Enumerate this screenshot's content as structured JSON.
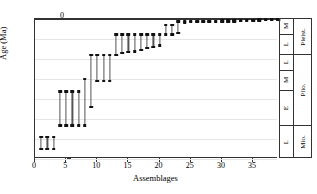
{
  "chart_data": {
    "type": "bar",
    "subtype": "range-bar-with-endpoint-markers",
    "title": "",
    "xlabel": "Assemblages",
    "ylabel": "Age (Ma)",
    "xlim": [
      0,
      39
    ],
    "ylim": [
      7,
      0
    ],
    "y_inverted": true,
    "xticks": [
      0,
      5,
      10,
      15,
      20,
      25,
      30,
      35
    ],
    "yticks": [
      0,
      1,
      2,
      3,
      4,
      5,
      6,
      7
    ],
    "grid": "horizontal",
    "legend": "none",
    "x": [
      1,
      2,
      3,
      4,
      5,
      6,
      7,
      8,
      9,
      10,
      11,
      12,
      13,
      14,
      15,
      16,
      17,
      18,
      19,
      20,
      21,
      22,
      23,
      24,
      25,
      26,
      27,
      28,
      29,
      30,
      31,
      32,
      33,
      34,
      35,
      36,
      37,
      38,
      39
    ],
    "series": [
      {
        "name": "Age range minimum (young end, Ma)",
        "values": [
          5.9,
          5.9,
          5.9,
          3.62,
          3.62,
          3.62,
          3.62,
          3.0,
          1.8,
          1.8,
          1.8,
          1.8,
          0.78,
          0.78,
          0.78,
          0.78,
          0.78,
          0.78,
          0.78,
          0.78,
          0.3,
          0.3,
          0.13,
          0.12,
          0.1,
          0.1,
          0.1,
          0.09,
          0.09,
          0.08,
          0.08,
          0.07,
          0.06,
          0.05,
          0.04,
          0.03,
          0.02,
          0.01,
          0.01
        ]
      },
      {
        "name": "Age range maximum (old end, Ma)",
        "values": [
          6.5,
          6.5,
          6.5,
          5.33,
          5.33,
          5.33,
          5.33,
          5.33,
          4.4,
          3.1,
          3.1,
          3.1,
          1.8,
          1.7,
          1.65,
          1.62,
          1.55,
          1.45,
          1.4,
          1.33,
          0.78,
          0.78,
          0.7,
          0.18,
          0.16,
          0.16,
          0.16,
          0.15,
          0.15,
          0.14,
          0.13,
          0.12,
          0.11,
          0.1,
          0.09,
          0.07,
          0.05,
          0.04,
          0.03
        ]
      }
    ]
  },
  "stratigraphy": {
    "column_title": "",
    "subepochs": [
      {
        "label": "M",
        "from_ma": 0.0,
        "to_ma": 0.78
      },
      {
        "label": "L",
        "from_ma": 0.78,
        "to_ma": 1.8
      },
      {
        "label": "L",
        "from_ma": 1.8,
        "to_ma": 2.58
      },
      {
        "label": "M",
        "from_ma": 2.58,
        "to_ma": 3.6
      },
      {
        "label": "E",
        "from_ma": 3.6,
        "to_ma": 5.33
      },
      {
        "label": "L",
        "from_ma": 5.33,
        "to_ma": 7.0
      }
    ],
    "epochs": [
      {
        "label": "Pleist.",
        "from_ma": 0.0,
        "to_ma": 1.8
      },
      {
        "label": "Plio.",
        "from_ma": 1.8,
        "to_ma": 5.33
      },
      {
        "label": "Mio.",
        "from_ma": 5.33,
        "to_ma": 7.0
      }
    ]
  },
  "axis": {
    "y_tick_labels": [
      "0",
      "1",
      "2",
      "3",
      "4",
      "5",
      "6",
      "7"
    ],
    "x_tick_labels": [
      "0",
      "5",
      "10",
      "15",
      "20",
      "25",
      "30",
      "35"
    ],
    "x_title": "Assemblages",
    "y_title": "Age (Ma)"
  }
}
